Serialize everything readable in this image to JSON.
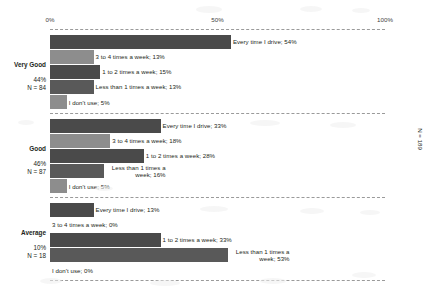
{
  "chart_data": {
    "type": "bar",
    "orientation": "horizontal",
    "title": "",
    "xlabel": "",
    "ylabel": "",
    "xlim": [
      0,
      100
    ],
    "grid": false,
    "legend": "none",
    "xticks": [
      "0%",
      "50%",
      "100%"
    ],
    "xtick_values": [
      0,
      50,
      100
    ],
    "total_label": "N = 189",
    "answer_categories": [
      "Every time I drive",
      "3 to 4 times a week",
      "1 to 2 times a week",
      "Less than 1 times a week",
      "I don't use"
    ],
    "groups": [
      {
        "name": "Very Good",
        "share": "44%",
        "n": "N = 84",
        "bars": [
          {
            "label": "Every time I drive; 54%",
            "value": 54,
            "shade": "dark"
          },
          {
            "label": "3 to 4 times a week; 13%",
            "value": 13,
            "shade": "light"
          },
          {
            "label": "1 to 2 times a week; 15%",
            "value": 15,
            "shade": "dark"
          },
          {
            "label": "Less than 1 times a week; 13%",
            "value": 13,
            "shade": "mid"
          },
          {
            "label": "I don't use; 5%",
            "value": 5,
            "shade": "light"
          }
        ]
      },
      {
        "name": "Good",
        "share": "46%",
        "n": "N = 87",
        "bars": [
          {
            "label": "Every time I drive; 33%",
            "value": 33,
            "shade": "dark"
          },
          {
            "label": "3 to 4 times a week; 18%",
            "value": 18,
            "shade": "light"
          },
          {
            "label": "1 to 2 times a week; 28%",
            "value": 28,
            "shade": "dark"
          },
          {
            "label": "Less than 1 times a week; 16%",
            "value": 16,
            "shade": "mid",
            "wrap": true
          },
          {
            "label": "I don't use; 5%",
            "value": 5,
            "shade": "light"
          }
        ]
      },
      {
        "name": "Average",
        "share": "10%",
        "n": "N = 18",
        "bars": [
          {
            "label": "Every time I drive; 13%",
            "value": 13,
            "shade": "dark"
          },
          {
            "label": "3 to 4 times a week; 0%",
            "value": 0,
            "shade": "light"
          },
          {
            "label": "1 to 2 times a week; 33%",
            "value": 33,
            "shade": "dark"
          },
          {
            "label": "Less than 1 times a week; 53%",
            "value": 53,
            "shade": "mid",
            "wrap": true
          },
          {
            "label": "I don't use; 0%",
            "value": 0,
            "shade": "light"
          }
        ]
      }
    ],
    "colors": {
      "dark": "#4a4a4a",
      "mid": "#595959",
      "light": "#8d8d8d",
      "axis_text": "#3f3f3f",
      "grid_dash": "#9a9a9a",
      "background": "#ffffff"
    }
  }
}
